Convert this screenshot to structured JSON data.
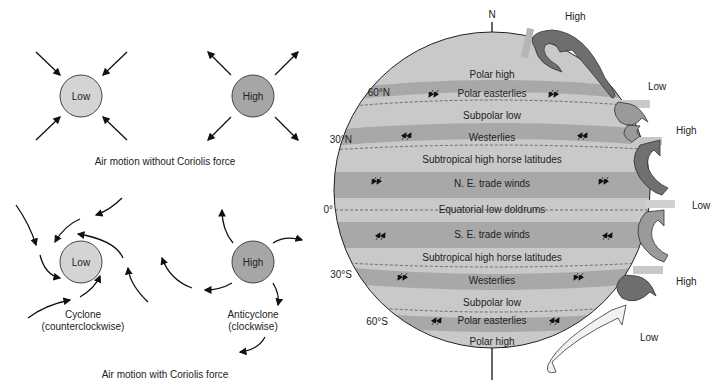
{
  "left_panel": {
    "without_coriolis": {
      "caption": "Air motion without Coriolis force",
      "low_label": "Low",
      "high_label": "High"
    },
    "with_coriolis": {
      "caption": "Air motion with Coriolis force",
      "low_label": "Low",
      "high_label": "High",
      "cyclone_line1": "Cyclone",
      "cyclone_line2": "(counterclockwise)",
      "anticyclone_line1": "Anticyclone",
      "anticyclone_line2": "(clockwise)"
    }
  },
  "globe": {
    "north_label": "N",
    "latitudes": {
      "n60": "60°N",
      "n30": "30°N",
      "eq": "0°",
      "s30": "30°S",
      "s60": "60°S"
    },
    "bands": [
      {
        "label": "Polar high"
      },
      {
        "label": "Polar easterlies"
      },
      {
        "label": "Subpolar low"
      },
      {
        "label": "Westerlies"
      },
      {
        "label": "Subtropical high horse latitudes"
      },
      {
        "label": "N. E. trade winds"
      },
      {
        "label": "Equatorial low doldrums"
      },
      {
        "label": "S. E. trade winds"
      },
      {
        "label": "Subtropical high horse latitudes"
      },
      {
        "label": "Westerlies"
      },
      {
        "label": "Subpolar low"
      },
      {
        "label": "Polar easterlies"
      },
      {
        "label": "Polar high"
      }
    ],
    "colors": {
      "light_band": "#c9c9c9",
      "dark_band": "#a8a8a8",
      "low_circle": "#d4d4d4",
      "high_circle": "#a6a6a6"
    }
  },
  "cells": {
    "labels": [
      "High",
      "Low",
      "High",
      "Low",
      "High",
      "Low"
    ]
  }
}
